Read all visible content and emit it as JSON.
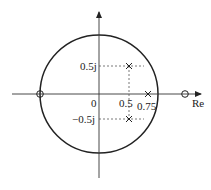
{
  "diagram": {
    "type": "pole-zero plot",
    "unit_circle": true,
    "axes": {
      "x_label": "Re",
      "origin_label": "0"
    },
    "tick_labels": {
      "real_0_5": "0.5",
      "real_0_75": "0.75",
      "imag_pos": "0.5j",
      "imag_neg": "−0.5j"
    },
    "poles": [
      {
        "re": 0.5,
        "im": 0.5,
        "marker": "x"
      },
      {
        "re": 0.5,
        "im": -0.5,
        "marker": "x"
      },
      {
        "re": 0.75,
        "im": 0,
        "marker": "x"
      }
    ],
    "zeros": [
      {
        "re": -1,
        "im": 0,
        "marker": "o"
      },
      {
        "re": 1.5,
        "im": 0,
        "marker": "o"
      }
    ],
    "colors": {
      "stroke": "#222222",
      "dashed": "#555555"
    }
  }
}
